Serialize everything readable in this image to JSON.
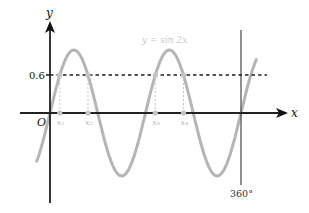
{
  "chart_data": {
    "type": "line",
    "title": "y = sin 2x",
    "function_label": "y = sin 2x",
    "xlabel": "x",
    "ylabel": "y",
    "origin_label": "O",
    "y_marker": {
      "label": "0.6",
      "value": 0.6,
      "style": "dashed horizontal line"
    },
    "x_marker": {
      "label": "360°",
      "value": 360,
      "style": "solid vertical line"
    },
    "intersection_labels": [
      "x₁",
      "x₂",
      "x₃",
      "x₄"
    ],
    "intersection_values_deg": [
      18.4,
      71.6,
      198.4,
      251.6
    ],
    "series": [
      {
        "name": "y = sin 2x",
        "color": "#b5b5b5",
        "x_range_deg": [
          -25,
          390
        ]
      }
    ],
    "xlim": [
      -30,
      400
    ],
    "ylim": [
      -1.1,
      1.4
    ],
    "grid": false,
    "legend": "none"
  },
  "colors": {
    "axis": "#222222",
    "curve": "#b5b5b5",
    "label_grey": "#c8c8c8",
    "dashed": "#222222",
    "drop_lines": "#c0c0c0",
    "vertical_360": "#555555"
  }
}
